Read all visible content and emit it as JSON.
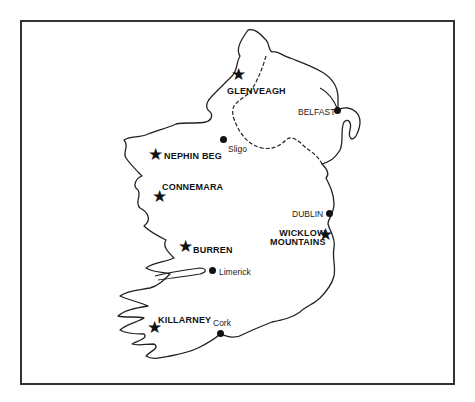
{
  "map": {
    "title": "",
    "parks": [
      {
        "name": "GLENVEAGH",
        "type": "national-park"
      },
      {
        "name": "NEPHIN BEG",
        "type": "national-park"
      },
      {
        "name": "CONNEMARA",
        "type": "national-park"
      },
      {
        "name": "BURREN",
        "type": "national-park"
      },
      {
        "name": "KILLARNEY",
        "type": "national-park"
      },
      {
        "name": "WICKLOW",
        "name2": "MOUNTAINS",
        "type": "national-park"
      }
    ],
    "cities": [
      {
        "name": "BELFAST"
      },
      {
        "name": "Sligo"
      },
      {
        "name": "DUBLIN"
      },
      {
        "name": "Limerick"
      },
      {
        "name": "Cork"
      }
    ],
    "symbols": {
      "park": "star-icon",
      "city": "dot-icon"
    },
    "colors": {
      "outline": "#222222",
      "background": "#ffffff",
      "frame": "#333333"
    }
  }
}
